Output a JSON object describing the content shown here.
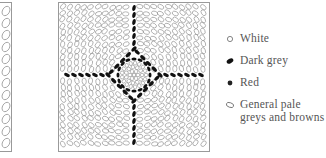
{
  "figure": {
    "colors": {
      "outline": "#9a9a9a",
      "dark_grey": "#111111",
      "red": "#222222",
      "pale": "#ffffff"
    }
  },
  "legend": {
    "items": [
      {
        "symbol": "open-circle",
        "label": "White"
      },
      {
        "symbol": "filled-ellipse",
        "label": "Dark grey"
      },
      {
        "symbol": "filled-dot",
        "label": "Red"
      },
      {
        "symbol": "open-ellipse",
        "label": "General pale\ngreys and browns"
      }
    ]
  }
}
